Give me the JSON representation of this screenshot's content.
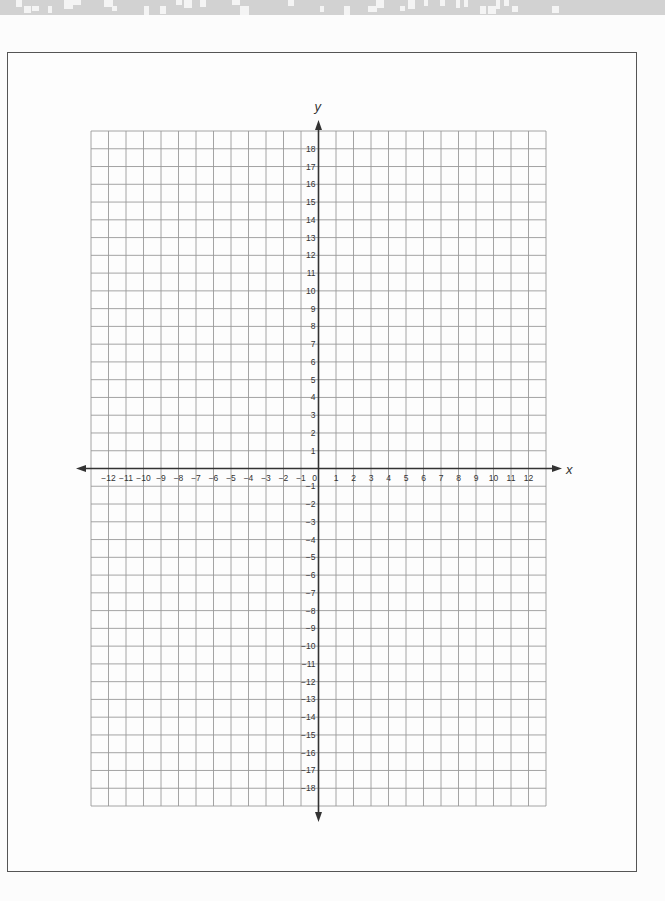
{
  "page": {
    "kind": "blank coordinate grid worksheet"
  },
  "graph": {
    "x_axis_label": "x",
    "y_axis_label": "y",
    "x_min": -12,
    "x_max": 12,
    "y_min": -18,
    "y_max": 18,
    "grid_x_cells": [
      -13,
      13
    ],
    "grid_y_cells": [
      -19,
      19
    ],
    "colors": {
      "grid": "#9a9a9a",
      "axis": "#333333",
      "frame": "#555555",
      "top_strip": "#d2d2d2"
    }
  },
  "chart_data": {
    "type": "scatter",
    "title": "",
    "xlabel": "x",
    "ylabel": "y",
    "xlim": [
      -13,
      13
    ],
    "ylim": [
      -19,
      19
    ],
    "grid": true,
    "x_tick_labels": [
      "-12",
      "-11",
      "-10",
      "-9",
      "-8",
      "-7",
      "-6",
      "-5",
      "-4",
      "-3",
      "-2",
      "-1",
      "0",
      "1",
      "2",
      "3",
      "4",
      "5",
      "6",
      "7",
      "8",
      "9",
      "10",
      "11",
      "12"
    ],
    "y_tick_labels": [
      "18",
      "17",
      "16",
      "15",
      "14",
      "13",
      "12",
      "11",
      "10",
      "9",
      "8",
      "7",
      "6",
      "5",
      "4",
      "3",
      "2",
      "1",
      "-1",
      "-2",
      "-3",
      "-4",
      "-5",
      "-6",
      "-7",
      "-8",
      "-9",
      "-10",
      "-11",
      "-12",
      "-13",
      "-14",
      "-15",
      "-16",
      "-17",
      "-18"
    ],
    "series": []
  }
}
